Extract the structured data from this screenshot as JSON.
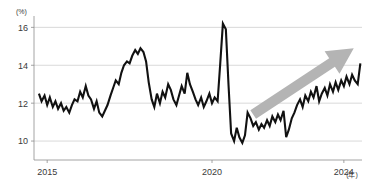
{
  "chart_data": {
    "type": "line",
    "title": "",
    "subtitle": "",
    "xlabel": "(年)",
    "ylabel": "(%)",
    "y_unit_label": "(%)",
    "x_unit_label": "(年)",
    "xlim": [
      2014.6,
      2024.55
    ],
    "ylim": [
      9.0,
      16.6
    ],
    "yticks": [
      10,
      12,
      14,
      16
    ],
    "ytick_labels": [
      "10",
      "12",
      "14",
      "16"
    ],
    "xticks": [
      2015,
      2020,
      2024
    ],
    "xtick_labels": [
      "2015",
      "2020",
      "2024"
    ],
    "grid": "horizontal",
    "legend": "none",
    "series": [
      {
        "name": "series-1",
        "color": "#111111",
        "x": [
          2014.75,
          2014.83,
          2014.92,
          2015.0,
          2015.08,
          2015.17,
          2015.25,
          2015.33,
          2015.42,
          2015.5,
          2015.58,
          2015.67,
          2015.75,
          2015.83,
          2015.92,
          2016.0,
          2016.08,
          2016.17,
          2016.25,
          2016.33,
          2016.42,
          2016.5,
          2016.58,
          2016.67,
          2016.75,
          2016.83,
          2016.92,
          2017.0,
          2017.08,
          2017.17,
          2017.25,
          2017.33,
          2017.42,
          2017.5,
          2017.58,
          2017.67,
          2017.75,
          2017.83,
          2017.92,
          2018.0,
          2018.08,
          2018.17,
          2018.25,
          2018.33,
          2018.42,
          2018.5,
          2018.58,
          2018.67,
          2018.75,
          2018.83,
          2018.92,
          2019.0,
          2019.08,
          2019.17,
          2019.25,
          2019.33,
          2019.42,
          2019.5,
          2019.58,
          2019.67,
          2019.75,
          2019.83,
          2019.92,
          2020.0,
          2020.08,
          2020.17,
          2020.25,
          2020.33,
          2020.42,
          2020.5,
          2020.58,
          2020.67,
          2020.75,
          2020.83,
          2020.92,
          2021.0,
          2021.08,
          2021.17,
          2021.25,
          2021.33,
          2021.42,
          2021.5,
          2021.58,
          2021.67,
          2021.75,
          2021.83,
          2021.92,
          2022.0,
          2022.08,
          2022.17,
          2022.25,
          2022.33,
          2022.42,
          2022.5,
          2022.58,
          2022.67,
          2022.75,
          2022.83,
          2022.92,
          2023.0,
          2023.08,
          2023.17,
          2023.25,
          2023.33,
          2023.42,
          2023.5,
          2023.58,
          2023.67,
          2023.75,
          2023.83,
          2023.92,
          2024.0,
          2024.08,
          2024.17,
          2024.25,
          2024.33,
          2024.42,
          2024.5
        ],
        "y": [
          12.5,
          12.1,
          12.4,
          11.9,
          12.3,
          11.8,
          12.1,
          11.7,
          12.0,
          11.6,
          11.8,
          11.5,
          11.9,
          12.2,
          12.1,
          12.6,
          12.3,
          12.9,
          12.4,
          12.2,
          11.7,
          12.1,
          11.5,
          11.3,
          11.6,
          11.9,
          12.4,
          12.8,
          13.2,
          13.0,
          13.6,
          14.0,
          14.2,
          14.1,
          14.5,
          14.8,
          14.6,
          14.9,
          14.7,
          14.2,
          13.1,
          12.2,
          11.8,
          12.5,
          12.0,
          12.6,
          12.3,
          13.0,
          12.7,
          12.2,
          11.9,
          12.4,
          12.9,
          12.5,
          13.6,
          13.0,
          12.6,
          12.2,
          11.9,
          12.3,
          11.8,
          12.1,
          12.5,
          12.0,
          12.3,
          12.1,
          14.1,
          16.2,
          15.9,
          13.0,
          10.4,
          10.0,
          10.7,
          10.2,
          9.9,
          10.3,
          11.5,
          11.2,
          10.8,
          11.0,
          10.6,
          10.9,
          10.7,
          11.1,
          10.8,
          11.3,
          11.0,
          11.4,
          11.1,
          11.6,
          10.2,
          10.6,
          11.2,
          11.5,
          11.9,
          12.2,
          11.8,
          12.4,
          12.1,
          12.6,
          12.3,
          12.9,
          12.1,
          12.5,
          12.8,
          12.4,
          13.0,
          12.6,
          13.1,
          12.7,
          13.2,
          12.9,
          13.4,
          13.0,
          13.5,
          13.2,
          13.0,
          14.1
        ]
      }
    ],
    "annotations": [
      {
        "name": "upward-trend-arrow",
        "type": "arrow",
        "color": "#b4b4b4",
        "from": [
          2021.25,
          11.4
        ],
        "to": [
          2024.3,
          14.9
        ]
      }
    ]
  }
}
